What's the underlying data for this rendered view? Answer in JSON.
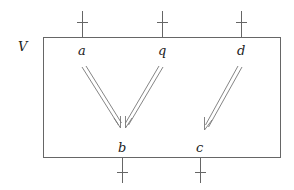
{
  "diagram": {
    "box_label": "V",
    "box": {
      "x": 43,
      "y": 37,
      "width": 237,
      "height": 120
    },
    "top_ports": [
      {
        "id": "a",
        "label": "a",
        "x": 82
      },
      {
        "id": "q",
        "label": "q",
        "x": 162
      },
      {
        "id": "d",
        "label": "d",
        "x": 241
      }
    ],
    "bottom_ports": [
      {
        "id": "b",
        "label": "b",
        "x": 122
      },
      {
        "id": "c",
        "label": "c",
        "x": 200
      }
    ],
    "arrows": [
      {
        "from": "a",
        "to": "b",
        "style": "double"
      },
      {
        "from": "q",
        "to": "b",
        "style": "double"
      },
      {
        "from": "d",
        "to": "c",
        "style": "double"
      }
    ],
    "colors": {
      "line": "#666666",
      "text": "#222222",
      "background": "#ffffff"
    }
  }
}
